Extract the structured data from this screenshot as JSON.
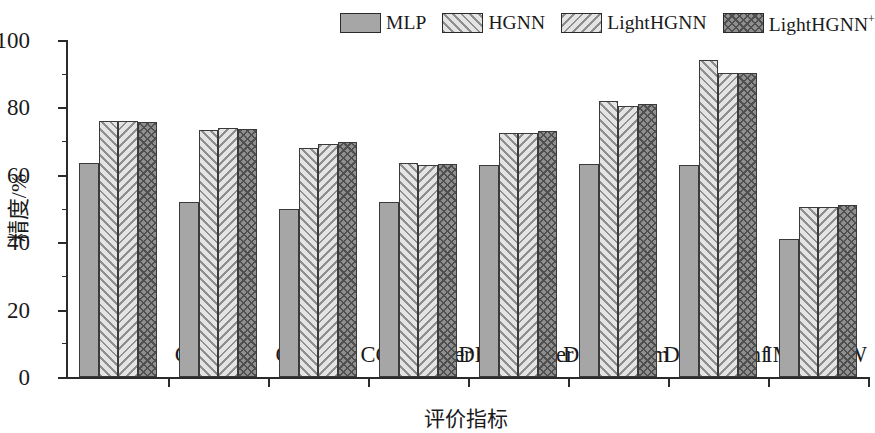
{
  "chart_data": {
    "type": "bar",
    "title": "",
    "xlabel": "评价指标",
    "ylabel": "精度/%",
    "ylim": [
      0,
      100
    ],
    "ytick_labels": [
      "0",
      "20",
      "40",
      "60",
      "80",
      "100"
    ],
    "ytick_values": [
      0,
      20,
      40,
      60,
      80,
      100
    ],
    "yminor_values": [
      10,
      30,
      50,
      70,
      90
    ],
    "grid": false,
    "legend_position": "top-right",
    "categories": [
      "News20",
      "CA-Cora",
      "CC-Cora",
      "CC-Citeseer",
      "DBLP-paper",
      "DBLP-term",
      "DBLP-conf",
      "IMDB-AW"
    ],
    "series": [
      {
        "name": "MLP",
        "pattern": "solid",
        "color": "#a6a6a6",
        "values": [
          63.5,
          52.0,
          50.0,
          52.0,
          63.0,
          63.3,
          63.0,
          41.0
        ]
      },
      {
        "name": "HGNN",
        "pattern": "forward-diagonal-hatch",
        "color": "#e4e4e4",
        "values": [
          76.0,
          73.3,
          68.0,
          63.5,
          72.3,
          82.0,
          94.0,
          50.5
        ]
      },
      {
        "name": "LightHGNN",
        "pattern": "backward-diagonal-hatch",
        "color": "#e4e4e4",
        "values": [
          76.0,
          73.8,
          69.0,
          63.0,
          72.5,
          80.5,
          90.3,
          50.5
        ]
      },
      {
        "name": "LightHGNN⁺",
        "pattern": "cross-hatch",
        "color": "#8f8f8f",
        "values": [
          75.8,
          73.5,
          69.8,
          63.3,
          73.0,
          81.0,
          90.2,
          51.0
        ]
      }
    ]
  },
  "legend": {
    "entries": [
      {
        "label": "MLP",
        "sup": ""
      },
      {
        "label": "HGNN",
        "sup": ""
      },
      {
        "label": "LightHGNN",
        "sup": ""
      },
      {
        "label": "LightHGNN",
        "sup": "+"
      }
    ]
  },
  "axis": {
    "y_title": "精度/%",
    "x_title": "评价指标"
  }
}
